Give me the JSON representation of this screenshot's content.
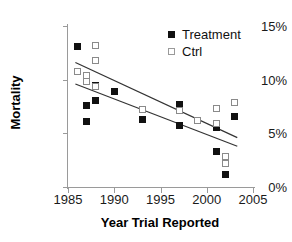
{
  "chart_data": {
    "type": "scatter",
    "title": "",
    "xlabel": "Year Trial Reported",
    "ylabel": "Mortality",
    "xlim": [
      1985,
      2005
    ],
    "ylim": [
      0,
      15
    ],
    "xticks": [
      1985,
      1990,
      1995,
      2000,
      2005
    ],
    "xtick_labels": [
      "1985",
      "1990",
      "1995",
      "2000",
      "2005"
    ],
    "yticks": [
      0,
      5,
      10,
      15
    ],
    "ytick_labels": [
      "0%",
      "5%",
      "10%",
      "15%"
    ],
    "grid": false,
    "legend_position": "top-right",
    "series": [
      {
        "name": "Treatment",
        "marker": "filled-square",
        "color": "#111111",
        "points": [
          {
            "x": 1986,
            "y": 13.1
          },
          {
            "x": 1987,
            "y": 7.6
          },
          {
            "x": 1987,
            "y": 6.1
          },
          {
            "x": 1988,
            "y": 9.5
          },
          {
            "x": 1988,
            "y": 8.1
          },
          {
            "x": 1990,
            "y": 8.9
          },
          {
            "x": 1993,
            "y": 6.3
          },
          {
            "x": 1997,
            "y": 7.7
          },
          {
            "x": 1997,
            "y": 5.7
          },
          {
            "x": 2001,
            "y": 5.5
          },
          {
            "x": 2001,
            "y": 3.3
          },
          {
            "x": 2002,
            "y": 1.2
          },
          {
            "x": 2003,
            "y": 6.6
          }
        ]
      },
      {
        "name": "Ctrl",
        "marker": "open-square",
        "color": "#ffffff",
        "points": [
          {
            "x": 1986,
            "y": 10.8
          },
          {
            "x": 1987,
            "y": 10.4
          },
          {
            "x": 1987,
            "y": 9.8
          },
          {
            "x": 1988,
            "y": 13.2
          },
          {
            "x": 1988,
            "y": 11.8
          },
          {
            "x": 1988,
            "y": 9.4
          },
          {
            "x": 1993,
            "y": 7.2
          },
          {
            "x": 1997,
            "y": 7.1
          },
          {
            "x": 1999,
            "y": 6.2
          },
          {
            "x": 2001,
            "y": 7.3
          },
          {
            "x": 2001,
            "y": 5.9
          },
          {
            "x": 2002,
            "y": 2.8
          },
          {
            "x": 2002,
            "y": 2.2
          },
          {
            "x": 2003,
            "y": 7.9
          }
        ]
      }
    ],
    "trendlines": [
      {
        "name": "Ctrl trend",
        "x0": 1985.8,
        "y0": 11.6,
        "x1": 2003.3,
        "y1": 4.6
      },
      {
        "name": "Treatment trend",
        "x0": 1985.8,
        "y0": 9.6,
        "x1": 2003.3,
        "y1": 3.8
      }
    ]
  },
  "legend": {
    "entries": [
      {
        "label": "Treatment"
      },
      {
        "label": "Ctrl"
      }
    ]
  }
}
